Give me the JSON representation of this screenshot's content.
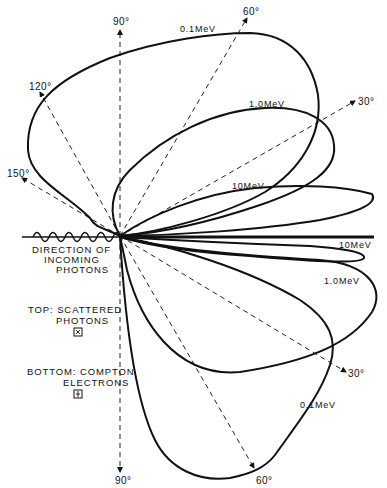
{
  "diagram": {
    "type": "polar-angular-distribution",
    "angle_labels": {
      "top": [
        "90°",
        "60°",
        "30°",
        "120°",
        "150°"
      ],
      "bottom": [
        "90°",
        "60°",
        "30°"
      ]
    },
    "energy_labels": {
      "top_01": "0.1MeV",
      "top_10": "1.0MeV",
      "top_100": "10MeV",
      "bottom_100": "10MeV",
      "bottom_10": "1.0MeV",
      "bottom_01": "0.1MeV"
    },
    "incoming": {
      "line1": "DIRECTION OF",
      "line2": "INCOMING",
      "line3": "PHOTONS"
    },
    "legend": {
      "top_line1": "TOP: SCATTERED",
      "top_line2": "PHOTONS",
      "top_symbol": "⊠",
      "bottom_line1": "BOTTOM: COMPTON",
      "bottom_line2": "ELECTRONS",
      "bottom_symbol": "⊟"
    }
  }
}
